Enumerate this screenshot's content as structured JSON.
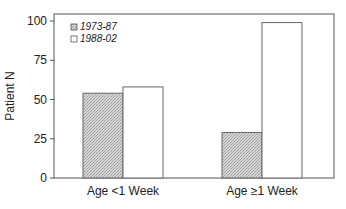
{
  "chart_data": {
    "type": "bar",
    "title": "",
    "xlabel": "",
    "ylabel": "Patient N",
    "categories": [
      "Age <1 Week",
      "Age ≥1 Week"
    ],
    "series": [
      {
        "name": "1973-87",
        "values": [
          54,
          29
        ],
        "fill": "hatched",
        "color": "#c8c8c8"
      },
      {
        "name": "1988-02",
        "values": [
          58,
          99
        ],
        "fill": "open",
        "color": "#ffffff"
      }
    ],
    "ylim": [
      0,
      100
    ],
    "yticks": [
      0,
      25,
      50,
      75,
      100
    ],
    "grid": false,
    "legend_position": "upper-left-inside"
  },
  "axis": {
    "ylabel": "Patient N",
    "yticks": [
      "0",
      "25",
      "50",
      "75",
      "100"
    ]
  },
  "legend": {
    "items": [
      {
        "label": "1973-87"
      },
      {
        "label": "1988-02"
      }
    ]
  },
  "categories": [
    {
      "label": "Age <1 Week"
    },
    {
      "label": "Age ≥1 Week"
    }
  ],
  "colors": {
    "axis": "#555555",
    "bar_outline": "#666666",
    "hatch_bg": "#d4d4d4",
    "hatch_fg": "#9a9a9a"
  }
}
